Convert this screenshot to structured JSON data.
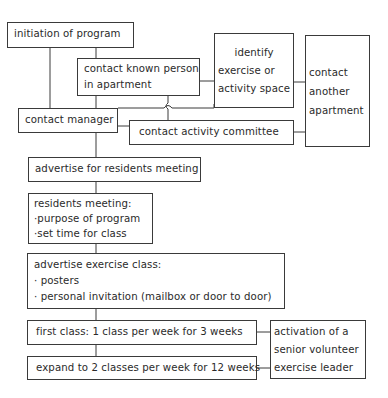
{
  "diagram": {
    "type": "flowchart",
    "nodes": {
      "initiation": {
        "lines": [
          "initiation of program"
        ]
      },
      "contact_known_person": {
        "lines": [
          "contact known person",
          "in apartment"
        ]
      },
      "identify_space": {
        "lines": [
          "identify",
          "exercise or",
          "activity space"
        ]
      },
      "contact_another_apartment": {
        "lines": [
          "contact",
          "another",
          "apartment"
        ]
      },
      "contact_manager": {
        "lines": [
          "contact manager"
        ]
      },
      "contact_activity_committee": {
        "lines": [
          "contact activity committee"
        ]
      },
      "advertise_residents_meeting": {
        "lines": [
          "advertise for residents meeting"
        ]
      },
      "residents_meeting": {
        "lines": [
          "residents meeting:",
          "·purpose of program",
          "·set time for class"
        ]
      },
      "advertise_exercise_class": {
        "lines": [
          "advertise exercise class:",
          "· posters",
          "· personal invitation (mailbox or door to door)"
        ]
      },
      "first_class": {
        "lines": [
          "first class: 1 class per week for 3 weeks"
        ]
      },
      "expand_classes": {
        "lines": [
          "expand to 2 classes per week for 12 weeks"
        ]
      },
      "senior_volunteer": {
        "lines": [
          "activation of a",
          "senior volunteer",
          "exercise leader"
        ]
      }
    },
    "edges": [
      [
        "initiation",
        "contact_manager"
      ],
      [
        "initiation",
        "contact_known_person"
      ],
      [
        "contact_known_person",
        "contact_manager"
      ],
      [
        "contact_known_person",
        "identify_space"
      ],
      [
        "contact_known_person",
        "contact_activity_committee"
      ],
      [
        "identify_space",
        "contact_another_apartment"
      ],
      [
        "contact_activity_committee",
        "contact_another_apartment"
      ],
      [
        "contact_manager",
        "contact_activity_committee"
      ],
      [
        "contact_manager",
        "advertise_residents_meeting"
      ],
      [
        "advertise_residents_meeting",
        "residents_meeting"
      ],
      [
        "residents_meeting",
        "advertise_exercise_class"
      ],
      [
        "advertise_exercise_class",
        "first_class"
      ],
      [
        "first_class",
        "expand_classes"
      ],
      [
        "first_class",
        "senior_volunteer"
      ],
      [
        "expand_classes",
        "senior_volunteer"
      ]
    ]
  }
}
